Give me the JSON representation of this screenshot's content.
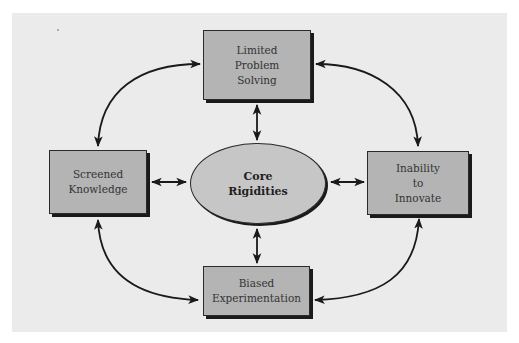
{
  "diagram": {
    "center": {
      "lines": [
        "Core",
        "Rigidities"
      ]
    },
    "nodes": {
      "top": {
        "lines": [
          "Limited",
          "Problem",
          "Solving"
        ]
      },
      "left": {
        "lines": [
          "Screened",
          "Knowledge"
        ]
      },
      "right": {
        "lines": [
          "Inability",
          "to",
          "Innovate"
        ]
      },
      "bottom": {
        "lines": [
          "Biased",
          "Experimentation"
        ]
      }
    },
    "connections": [
      {
        "from": "Core Rigidities",
        "to": "Limited Problem Solving",
        "type": "bidirectional"
      },
      {
        "from": "Core Rigidities",
        "to": "Screened Knowledge",
        "type": "bidirectional"
      },
      {
        "from": "Core Rigidities",
        "to": "Inability to Innovate",
        "type": "bidirectional"
      },
      {
        "from": "Core Rigidities",
        "to": "Biased Experimentation",
        "type": "bidirectional"
      },
      {
        "from": "Screened Knowledge",
        "to": "Limited Problem Solving",
        "type": "bidirectional-curved"
      },
      {
        "from": "Limited Problem Solving",
        "to": "Inability to Innovate",
        "type": "bidirectional-curved"
      },
      {
        "from": "Inability to Innovate",
        "to": "Biased Experimentation",
        "type": "bidirectional-curved"
      },
      {
        "from": "Biased Experimentation",
        "to": "Screened Knowledge",
        "type": "bidirectional-curved"
      }
    ],
    "colors": {
      "panel": "#ebebeb",
      "box_fill": "#b4b4b4",
      "ellipse_fill": "#c6c6c6",
      "stroke": "#1a1a1a"
    }
  }
}
